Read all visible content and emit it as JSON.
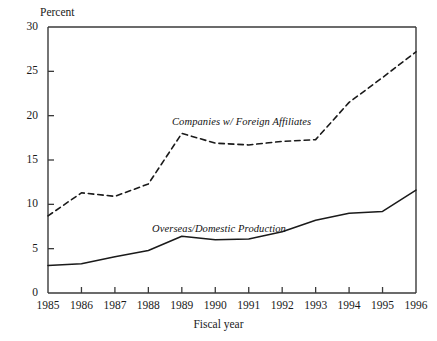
{
  "chart_data": {
    "type": "line",
    "title": "",
    "xlabel": "Fiscal year",
    "ylabel": "Percent",
    "x": [
      1985,
      1986,
      1987,
      1988,
      1989,
      1990,
      1991,
      1992,
      1993,
      1994,
      1995,
      1996
    ],
    "categories": [
      "1985",
      "1986",
      "1987",
      "1988",
      "1989",
      "1990",
      "1991",
      "1992",
      "1993",
      "1994",
      "1995",
      "1996"
    ],
    "xlim": [
      1985,
      1996
    ],
    "ylim": [
      0,
      30
    ],
    "yticks": [
      0,
      5,
      10,
      15,
      20,
      25,
      30
    ],
    "ytick_labels": [
      "0",
      "5",
      "10",
      "15",
      "20",
      "25",
      "30"
    ],
    "xticks": [
      1985,
      1986,
      1987,
      1988,
      1989,
      1990,
      1991,
      1992,
      1993,
      1994,
      1995,
      1996
    ],
    "xtick_labels": [
      "1985",
      "1986",
      "1987",
      "1988",
      "1989",
      "1990",
      "1991",
      "1992",
      "1993",
      "1994",
      "1995",
      "1996"
    ],
    "grid": false,
    "legend_position": "inline-annotation",
    "series": [
      {
        "name": "Companies w/ Foreign Affiliates",
        "style": "dashed",
        "color": "#1a1a1a",
        "values": [
          8.7,
          11.3,
          10.9,
          12.3,
          18.0,
          16.9,
          16.7,
          17.1,
          17.3,
          21.5,
          24.3,
          27.2
        ]
      },
      {
        "name": "Overseas/Domestic Production",
        "style": "solid",
        "color": "#1a1a1a",
        "values": [
          3.1,
          3.3,
          4.1,
          4.8,
          6.4,
          6.0,
          6.1,
          6.9,
          8.2,
          9.0,
          9.2,
          11.6
        ]
      }
    ],
    "annotations": [
      {
        "text": "Companies w/ Foreign Affiliates",
        "series": "Companies w/ Foreign Affiliates"
      },
      {
        "text": "Overseas/Domestic Production",
        "series": "Overseas/Domestic Production"
      }
    ]
  },
  "colors": {
    "axis": "#3a3a3a",
    "ink": "#1a1a1a",
    "background": "#ffffff"
  }
}
